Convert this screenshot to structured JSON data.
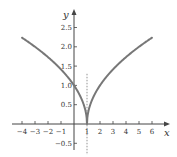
{
  "chart_data": {
    "type": "line",
    "title": "",
    "xlabel": "x",
    "ylabel": "y",
    "xlim": [
      -4,
      6
    ],
    "ylim": [
      -0.5,
      2.5
    ],
    "x_ticks": [
      -4,
      -3,
      -2,
      -1,
      1,
      2,
      3,
      4,
      5,
      6
    ],
    "x_tick_labels": [
      "-4",
      "-3",
      "-2",
      "-1",
      "1",
      "2",
      "3",
      "4",
      "5",
      "6"
    ],
    "y_ticks": [
      -0.5,
      0.5,
      1.0,
      1.5,
      2.0,
      2.5
    ],
    "y_tick_labels": [
      "-0.5",
      "0.5",
      "1.0",
      "1.5",
      "2.0",
      "2.5"
    ],
    "grid": false,
    "series": [
      {
        "name": "y = sqrt(|x - 1|)",
        "x": [
          -4,
          -3,
          -2,
          -1,
          0,
          0.5,
          0.9,
          1,
          1.1,
          1.5,
          2,
          3,
          4,
          5,
          6
        ],
        "y": [
          2.236,
          2.0,
          1.732,
          1.414,
          1.0,
          0.707,
          0.316,
          0,
          0.316,
          0.707,
          1.0,
          1.414,
          1.732,
          2.0,
          2.236
        ],
        "color": "#777777"
      }
    ],
    "annotations": [
      {
        "type": "vertical-dashed-line",
        "x": 1,
        "y_range": [
          -0.8,
          1.3
        ]
      }
    ]
  }
}
